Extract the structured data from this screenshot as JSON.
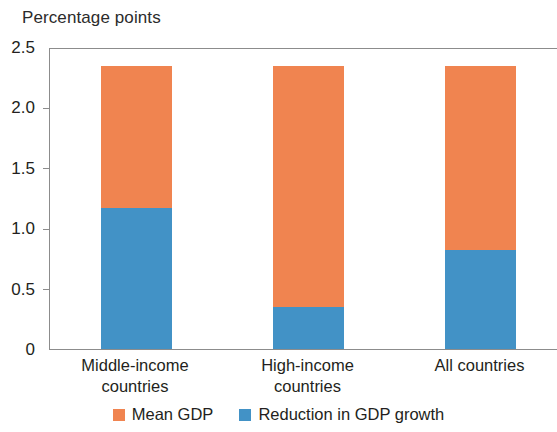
{
  "chart_data": {
    "type": "bar",
    "subtype": "stacked-bar",
    "title": "Percentage points",
    "xlabel": "",
    "ylabel": "Percentage points",
    "ylim": [
      0,
      2.5
    ],
    "grid": false,
    "legend_position": "bottom-center",
    "categories": [
      "Middle-income countries",
      "High-income countries",
      "All countries"
    ],
    "category_lines": [
      [
        "Middle-income",
        "countries"
      ],
      [
        "High-income",
        "countries"
      ],
      [
        "All countries",
        ""
      ]
    ],
    "y_ticks": [
      {
        "value": 2.5,
        "label": "2.5"
      },
      {
        "value": 2.0,
        "label": "2.0"
      },
      {
        "value": 1.5,
        "label": "1.5"
      },
      {
        "value": 1.0,
        "label": "1.0"
      },
      {
        "value": 0.5,
        "label": "0.5"
      },
      {
        "value": 0.0,
        "label": "0"
      }
    ],
    "series": [
      {
        "name": "Reduction in GDP growth",
        "color": "#4292c6",
        "values": [
          1.17,
          0.35,
          0.82
        ]
      },
      {
        "name": "Mean GDP",
        "color": "#f08450",
        "values": [
          1.17,
          1.99,
          1.52
        ]
      }
    ],
    "totals": [
      2.34,
      2.34,
      2.34
    ]
  },
  "legend": {
    "items": [
      {
        "label": "Mean GDP",
        "color": "#f08450"
      },
      {
        "label": "Reduction in GDP growth",
        "color": "#4292c6"
      }
    ]
  }
}
